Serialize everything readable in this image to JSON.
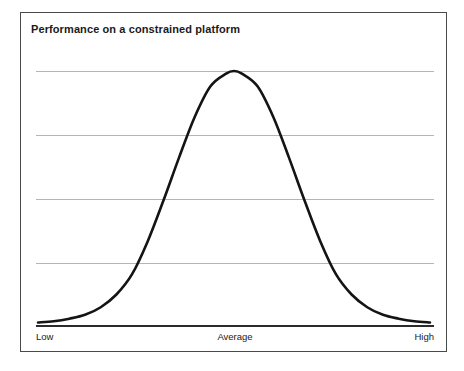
{
  "chart_data": {
    "type": "line",
    "title": "Performance on a constrained platform",
    "xlabel": "",
    "ylabel": "",
    "x_tick_labels": [
      "Low",
      "Average",
      "High"
    ],
    "y_tick_labels": [],
    "grid": true,
    "gridline_count": 4,
    "legend": null,
    "xlim": [
      0,
      100
    ],
    "ylim": [
      0,
      1
    ],
    "series": [
      {
        "name": "Performance distribution",
        "color": "#141414",
        "shape": "bell-curve",
        "peak_x": 50,
        "peak_y": 1.0,
        "x": [
          0,
          4,
          8,
          12,
          16,
          20,
          24,
          28,
          32,
          36,
          40,
          44,
          48,
          50,
          52,
          56,
          60,
          64,
          68,
          72,
          76,
          80,
          84,
          88,
          92,
          96,
          100
        ],
        "values": [
          0.01,
          0.015,
          0.025,
          0.04,
          0.07,
          0.12,
          0.2,
          0.33,
          0.49,
          0.66,
          0.82,
          0.94,
          0.99,
          1.0,
          0.99,
          0.94,
          0.82,
          0.66,
          0.49,
          0.33,
          0.2,
          0.12,
          0.07,
          0.04,
          0.025,
          0.015,
          0.01
        ]
      }
    ]
  },
  "figure": {
    "title": "Performance on a constrained platform",
    "axis": {
      "low_label": "Low",
      "average_label": "Average",
      "high_label": "High"
    },
    "colors": {
      "curve": "#141414",
      "gridline": "#b5b5b5",
      "baseline": "#2a2a2a",
      "border": "#4a4a4a",
      "text": "#1a1a1a",
      "background": "#ffffff"
    }
  }
}
